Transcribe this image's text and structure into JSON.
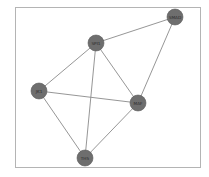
{
  "diagram": {
    "type": "network-graph",
    "colors": {
      "background": "#ffffff",
      "frame": "#b4b4b4",
      "edge": "#8a8a8a",
      "node_fill": "#6e6e6e",
      "label": "#2a2a2a"
    },
    "nodes": [
      {
        "id": "SPI1",
        "label": "SPI1",
        "x": 96,
        "y": 43
      },
      {
        "id": "SMAD",
        "label": "SMAD",
        "x": 175,
        "y": 17
      },
      {
        "id": "JK1",
        "label": "JK1",
        "x": 39,
        "y": 91
      },
      {
        "id": "MAF",
        "label": "MAF",
        "x": 138,
        "y": 103
      },
      {
        "id": "TH5",
        "label": "TH5",
        "x": 85,
        "y": 158
      }
    ],
    "edges": [
      {
        "source": "SPI1",
        "target": "SMAD"
      },
      {
        "source": "SPI1",
        "target": "JK1"
      },
      {
        "source": "SPI1",
        "target": "MAF"
      },
      {
        "source": "SPI1",
        "target": "TH5"
      },
      {
        "source": "SMAD",
        "target": "MAF"
      },
      {
        "source": "JK1",
        "target": "MAF"
      },
      {
        "source": "JK1",
        "target": "TH5"
      },
      {
        "source": "MAF",
        "target": "TH5"
      }
    ]
  }
}
